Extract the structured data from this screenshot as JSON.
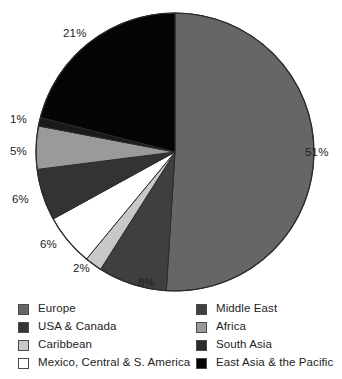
{
  "chart_data": {
    "type": "pie",
    "title": "",
    "subtitle": "",
    "xlabel": "",
    "ylabel": "",
    "grid": false,
    "legend_position": "bottom",
    "units": "percent",
    "total": 100,
    "start_angle_deg": 0,
    "direction": "clockwise",
    "categories": [
      "Europe",
      "Middle East",
      "Caribbean",
      "Mexico, Central & S. America",
      "USA & Canada",
      "Africa",
      "South Asia",
      "East Asia & the Pacific"
    ],
    "values": [
      51,
      8,
      2,
      6,
      6,
      5,
      1,
      21
    ],
    "labels": [
      "51%",
      "8%",
      "2%",
      "6%",
      "6%",
      "5%",
      "1%",
      "21%"
    ],
    "colors": [
      "#666666",
      "#3f3f3f",
      "#c8c8c8",
      "#ffffff",
      "#333333",
      "#9a9a9a",
      "#1a1a1a",
      "#050505"
    ],
    "slices": [
      {
        "name": "Europe",
        "value": 51,
        "label": "51%",
        "color": "#666666",
        "start_deg": 0,
        "end_deg": 183.6
      },
      {
        "name": "Middle East",
        "value": 8,
        "label": "8%",
        "color": "#3f3f3f",
        "start_deg": 183.6,
        "end_deg": 212.4
      },
      {
        "name": "Caribbean",
        "value": 2,
        "label": "2%",
        "color": "#c8c8c8",
        "start_deg": 212.4,
        "end_deg": 219.6
      },
      {
        "name": "Mexico, Central & S. America",
        "value": 6,
        "label": "6%",
        "color": "#ffffff",
        "start_deg": 219.6,
        "end_deg": 241.2
      },
      {
        "name": "USA & Canada",
        "value": 6,
        "label": "6%",
        "color": "#333333",
        "start_deg": 241.2,
        "end_deg": 262.8
      },
      {
        "name": "Africa",
        "value": 5,
        "label": "5%",
        "color": "#9a9a9a",
        "start_deg": 262.8,
        "end_deg": 280.8
      },
      {
        "name": "South Asia",
        "value": 1,
        "label": "1%",
        "color": "#1a1a1a",
        "start_deg": 280.8,
        "end_deg": 284.4
      },
      {
        "name": "East Asia & the Pacific",
        "value": 21,
        "label": "21%",
        "color": "#050505",
        "start_deg": 284.4,
        "end_deg": 360
      }
    ]
  },
  "pie": {
    "center_x": 175,
    "center_y": 152,
    "radius": 139,
    "outline_color": "#2a2a2a",
    "value_labels": [
      {
        "key": "europe",
        "text": "51%",
        "x": 305,
        "y": 147
      },
      {
        "key": "middle-east",
        "text": "8%",
        "x": 138,
        "y": 277
      },
      {
        "key": "caribbean",
        "text": "2%",
        "x": 73,
        "y": 263
      },
      {
        "key": "mexico",
        "text": "6%",
        "x": 40,
        "y": 239
      },
      {
        "key": "usa-canada",
        "text": "6%",
        "x": 12,
        "y": 194
      },
      {
        "key": "africa",
        "text": "5%",
        "x": 10,
        "y": 146
      },
      {
        "key": "south-asia",
        "text": "1%",
        "x": 10,
        "y": 114
      },
      {
        "key": "east-asia",
        "text": "21%",
        "x": 63,
        "y": 28
      }
    ]
  },
  "legend": {
    "left_column": [
      {
        "label": "Europe",
        "color": "#666666"
      },
      {
        "label": "USA & Canada",
        "color": "#333333"
      },
      {
        "label": "Caribbean",
        "color": "#c8c8c8"
      },
      {
        "label": "Mexico, Central & S. America",
        "color": "#ffffff"
      }
    ],
    "right_column": [
      {
        "label": "Middle East",
        "color": "#3f3f3f"
      },
      {
        "label": "Africa",
        "color": "#9a9a9a"
      },
      {
        "label": "South Asia",
        "color": "#2b2b2b"
      },
      {
        "label": "East Asia & the Pacific",
        "color": "#050505"
      }
    ]
  }
}
